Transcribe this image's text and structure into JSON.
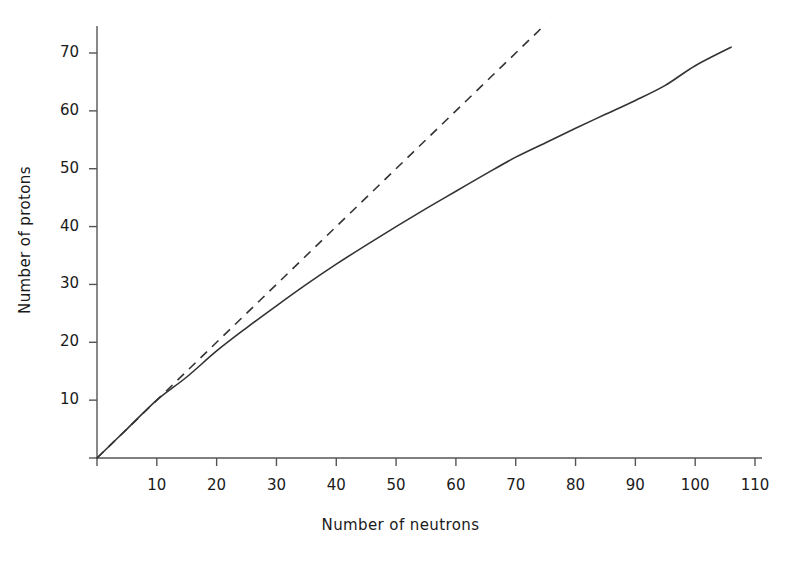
{
  "chart_data": {
    "type": "line",
    "title": "",
    "xlabel": "Number of neutrons",
    "ylabel": "Number of protons",
    "xlim": [
      0,
      113
    ],
    "ylim": [
      0,
      75
    ],
    "xticks": [
      0,
      10,
      20,
      30,
      40,
      50,
      60,
      70,
      80,
      90,
      100,
      110
    ],
    "xticklabels": [
      "",
      "10",
      "20",
      "30",
      "40",
      "50",
      "60",
      "70",
      "80",
      "90",
      "100",
      "110"
    ],
    "yticks": [
      0,
      10,
      20,
      30,
      40,
      50,
      60,
      70
    ],
    "yticklabels": [
      "",
      "10",
      "20",
      "30",
      "40",
      "50",
      "60",
      "70"
    ],
    "grid": false,
    "legend": "none",
    "series": [
      {
        "name": "stability-curve",
        "style": "solid",
        "color": "#333333",
        "x": [
          0,
          5,
          10,
          15,
          20,
          25,
          30,
          35,
          40,
          45,
          50,
          55,
          60,
          65,
          70,
          75,
          80,
          85,
          90,
          95,
          100,
          106
        ],
        "y": [
          0,
          5,
          10,
          14,
          18.5,
          22.5,
          26.3,
          30,
          33.5,
          36.8,
          40,
          43.1,
          46.1,
          49.1,
          52,
          54.5,
          57,
          59.4,
          61.8,
          64.4,
          67.8,
          71
        ]
      },
      {
        "name": "equal-numbers-line",
        "style": "dashed",
        "color": "#333333",
        "x": [
          0,
          75
        ],
        "y": [
          0,
          75
        ]
      }
    ]
  },
  "axes": {
    "x_axis_name": "x-axis",
    "y_axis_name": "y-axis"
  }
}
